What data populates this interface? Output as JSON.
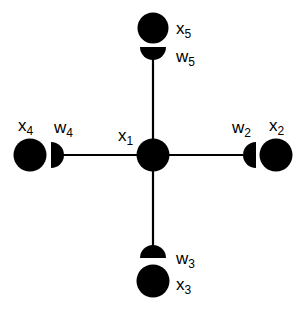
{
  "diagram": {
    "type": "star-network",
    "colors": {
      "node": "#000000",
      "edge": "#000000",
      "background": "#ffffff"
    },
    "center_node": {
      "id": "x1",
      "base": "x",
      "sub": "1"
    },
    "branches": [
      {
        "direction": "right",
        "node": {
          "base": "x",
          "sub": "2"
        },
        "weight": {
          "base": "w",
          "sub": "2"
        }
      },
      {
        "direction": "bottom",
        "node": {
          "base": "x",
          "sub": "3"
        },
        "weight": {
          "base": "w",
          "sub": "3"
        }
      },
      {
        "direction": "left",
        "node": {
          "base": "x",
          "sub": "4"
        },
        "weight": {
          "base": "w",
          "sub": "4"
        }
      },
      {
        "direction": "top",
        "node": {
          "base": "x",
          "sub": "5"
        },
        "weight": {
          "base": "w",
          "sub": "5"
        }
      }
    ]
  }
}
